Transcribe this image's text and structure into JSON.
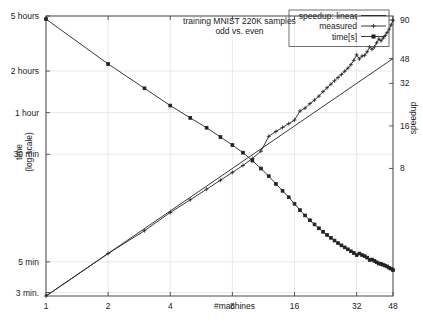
{
  "chart_data": {
    "type": "line",
    "title": "training MNIST 220K samples",
    "subtitle": "odd vs. even",
    "xlabel": "#machines",
    "ylabel": "time",
    "ylabel2": "(log-scale)",
    "y2label": "speedup",
    "xscale": "log",
    "yscale": "log",
    "xlim": [
      1,
      48
    ],
    "xticks": [
      1,
      2,
      4,
      8,
      16,
      32,
      48
    ],
    "xtick_labels": [
      "1",
      "2",
      "4",
      "8",
      "16",
      "32",
      "48"
    ],
    "ylim_seconds": [
      170,
      18000
    ],
    "yticks_seconds": [
      18000,
      7200,
      3600,
      1800,
      300,
      180
    ],
    "ytick_labels": [
      "5 hours",
      "2 hours",
      "1 hour",
      "30 min",
      "5 min",
      "3 min."
    ],
    "y2lim": [
      1,
      96
    ],
    "y2ticks": [
      90,
      48,
      32,
      16,
      8
    ],
    "y2tick_labels": [
      "90",
      "48",
      "32",
      "16",
      "8"
    ],
    "grid": true,
    "legend_position": "top-right",
    "series": [
      {
        "name": "speedup: linear",
        "axis": "right",
        "marker": "none",
        "x": [
          1,
          48
        ],
        "values": [
          1,
          48
        ]
      },
      {
        "name": "measured",
        "axis": "right",
        "marker": "plus",
        "x": [
          1,
          2,
          3,
          4,
          5,
          6,
          7,
          8,
          9,
          10,
          11,
          12,
          13,
          14,
          15,
          16,
          17,
          18,
          19,
          20,
          21,
          22,
          23,
          24,
          25,
          26,
          27,
          28,
          29,
          30,
          31,
          32,
          33,
          34,
          35,
          36,
          37,
          38,
          39,
          40,
          41,
          42,
          43,
          44,
          45,
          46,
          47,
          48
        ],
        "values": [
          1.0,
          2.0,
          2.9,
          3.9,
          4.8,
          5.7,
          6.6,
          7.5,
          8.4,
          9.4,
          10.6,
          13.5,
          14.6,
          15.6,
          16.6,
          17.6,
          20.4,
          21.4,
          23.0,
          24.4,
          26.0,
          28.0,
          29.8,
          31.6,
          33.4,
          35.2,
          37.0,
          39.0,
          41.0,
          43.4,
          46.6,
          51.0,
          47.6,
          50.0,
          50.6,
          53.6,
          58.0,
          55.8,
          58.0,
          62.0,
          66.0,
          64.0,
          67.0,
          70.0,
          73.5,
          77.5,
          83.0,
          89.5
        ]
      },
      {
        "name": "time[s]",
        "axis": "left",
        "marker": "square",
        "x": [
          1,
          2,
          3,
          4,
          5,
          6,
          7,
          8,
          9,
          10,
          11,
          12,
          13,
          14,
          15,
          16,
          17,
          18,
          19,
          20,
          21,
          22,
          23,
          24,
          25,
          26,
          27,
          28,
          29,
          30,
          31,
          32,
          33,
          34,
          35,
          36,
          37,
          38,
          39,
          40,
          41,
          42,
          43,
          44,
          45,
          46,
          47,
          48
        ],
        "values_seconds": [
          17100,
          8100,
          5400,
          4050,
          3300,
          2800,
          2400,
          2100,
          1850,
          1620,
          1420,
          1250,
          1100,
          980,
          880,
          790,
          710,
          650,
          600,
          560,
          525,
          495,
          470,
          448,
          428,
          410,
          395,
          382,
          370,
          358,
          348,
          336,
          345,
          336,
          330,
          322,
          310,
          312,
          305,
          298,
          292,
          290,
          286,
          282,
          278,
          272,
          268,
          262
        ]
      }
    ]
  },
  "axes": {
    "x_title": "#machines",
    "y_left_title_line1": "time",
    "y_left_title_line2": "(log-scale)",
    "y_right_title": "speedup"
  },
  "title": {
    "line1": "training MNIST 220K samples",
    "line2": "odd vs. even"
  },
  "legend": {
    "items": [
      {
        "label": "speedup: linear",
        "style": "plain-line"
      },
      {
        "label": "measured",
        "style": "line-plus"
      },
      {
        "label": "time[s]",
        "style": "line-square"
      }
    ]
  },
  "colors": {
    "line": "#222222",
    "grid": "#d9d9d9",
    "frame": "#4a4a4a",
    "background": "#ffffff",
    "text": "#1a1a1a"
  }
}
